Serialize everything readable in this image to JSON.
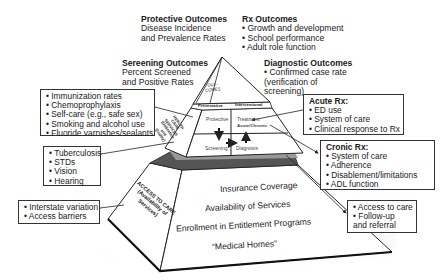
{
  "outcomes": {
    "protective": {
      "title": "Protective Outcomes",
      "lines": [
        "Disease Incidence",
        "and Prevalence Rates"
      ]
    },
    "rx": {
      "title": "Rx Outcomes",
      "items": [
        "Growth and development",
        "School performance",
        "Adult role function"
      ]
    },
    "screening": {
      "title": "Sereening Outcomes",
      "lines": [
        "Percent Screened",
        "and Positive Rates"
      ]
    },
    "diagnostic": {
      "title": "Diagnostic Outcomes",
      "lines": [
        "• Confirmed case rate",
        "(verification of",
        "screening)"
      ]
    }
  },
  "pyramid": {
    "apex_label": [
      "OUT-",
      "COMES"
    ],
    "tier2_header": {
      "left": "Preventative",
      "right": "Interventional"
    },
    "tier2_side_label": [
      "HEALTH",
      "CARE",
      "SERVICES",
      "(Utilization",
      "and",
      "Quality)"
    ],
    "quadrants": {
      "top_left": "Protective",
      "top_right": "Treatment",
      "top_right_sub": "Acute/Chronic",
      "bottom_left": "Screening",
      "bottom_right": "Diagnosis"
    },
    "base_side_label": [
      "ACCESS TO CARE",
      "(Availability of",
      "Services)"
    ],
    "base_items": [
      "Insurance Coverage",
      "Availability of Services",
      "Enrollment in Entitlement Programs",
      "“Medical Homes”"
    ]
  },
  "boxes": {
    "preventive": [
      "Immunization rates",
      "Chemoprophylaxis",
      "Self-care (e.g., safe sex)",
      "Smoking and alcohol use",
      "Fluoride varnishes/sealants"
    ],
    "screening": [
      "Tuberculosis",
      "STDs",
      "Vision",
      "Hearing"
    ],
    "access_left": [
      "Interstate variation",
      "Access barriers"
    ],
    "acute": {
      "title": "Acute Rx:",
      "items": [
        "ED use",
        "System of care",
        "Clinical response to Rx"
      ]
    },
    "chronic": {
      "title": "Cronic Rx:",
      "items": [
        "System of care",
        "Adherence",
        "Disablement/limitations",
        "ADL function"
      ]
    },
    "access_right": [
      "Access to care",
      "Follow-up",
      "and referral"
    ]
  },
  "bullet": "•",
  "colors": {
    "line": "#1a1a1a",
    "fill": "#ffffff",
    "shadow": "#9a9a9a",
    "text": "#1a1a1a"
  }
}
